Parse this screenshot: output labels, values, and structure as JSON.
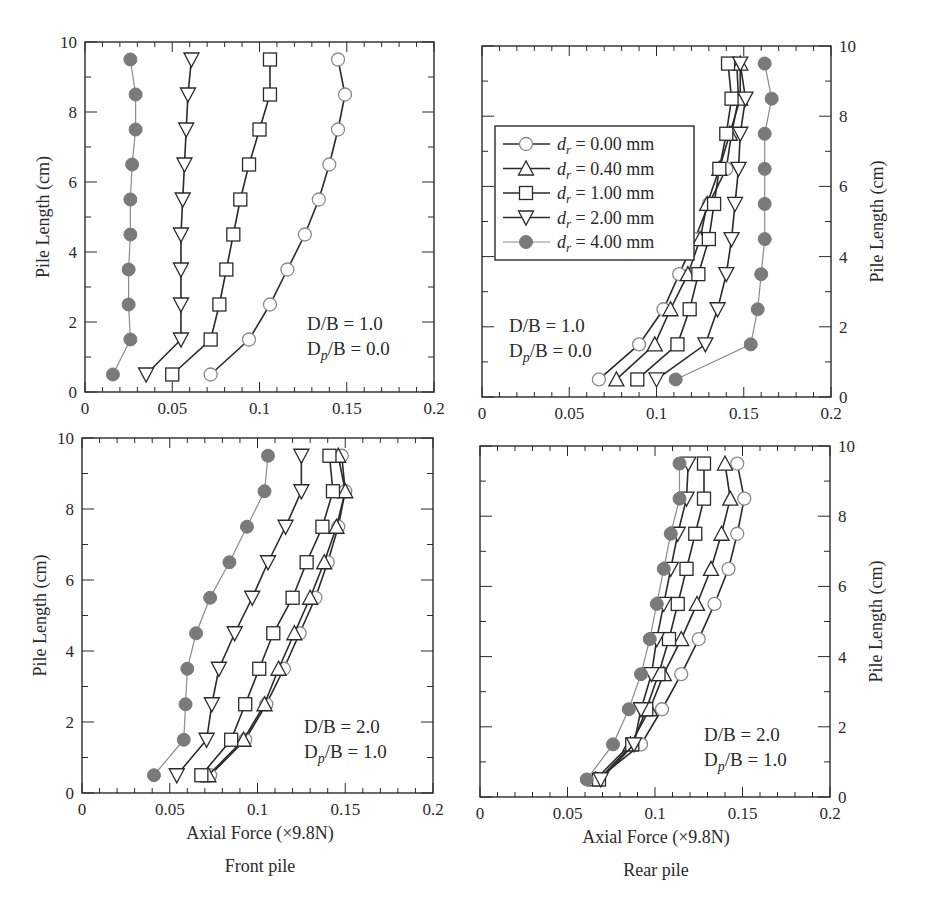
{
  "figure": {
    "captions": {
      "front_xlabel": "Axial Force (×9.8N)",
      "front_title": "Front pile",
      "rear_xlabel": "Axial Force (×9.8N)",
      "rear_title": "Rear pile"
    },
    "legend": [
      {
        "label": "d_r = 0.00 mm",
        "symbol": "r",
        "value": "= 0.00 mm",
        "marker": "circle-open",
        "color": "#2a2a2a"
      },
      {
        "label": "d_r = 0.40 mm",
        "symbol": "r",
        "value": "= 0.40 mm",
        "marker": "triangle-up-open",
        "color": "#2a2a2a"
      },
      {
        "label": "d_r = 1.00 mm",
        "symbol": "r",
        "value": "= 1.00 mm",
        "marker": "square-open",
        "color": "#2a2a2a"
      },
      {
        "label": "d_r = 2.00 mm",
        "symbol": "r",
        "value": "= 2.00 mm",
        "marker": "triangle-down-open",
        "color": "#2a2a2a"
      },
      {
        "label": "d_r = 4.00 mm",
        "symbol": "r",
        "value": "= 4.00 mm",
        "marker": "circle-filled",
        "color": "#7a7a7a"
      }
    ]
  },
  "chart_data": [
    {
      "type": "line",
      "panel": "top-left",
      "title": "Front pile",
      "annotation": [
        "D/B = 1.0",
        "Dp/B = 0.0"
      ],
      "xlabel": "",
      "ylabel": "Pile Length (cm)",
      "xlim": [
        0,
        0.2
      ],
      "ylim": [
        0,
        10
      ],
      "xticks": [
        "0",
        "0.05",
        "0.1",
        "0.15",
        "0.2"
      ],
      "yticks": [
        "0",
        "2",
        "4",
        "6",
        "8",
        "10"
      ],
      "y": [
        0.5,
        1.5,
        2.5,
        3.5,
        4.5,
        5.5,
        6.5,
        7.5,
        8.5,
        9.5
      ],
      "series": [
        {
          "name": "d_r = 0.00 mm",
          "values": [
            0.072,
            0.094,
            0.106,
            0.116,
            0.126,
            0.134,
            0.14,
            0.145,
            0.149,
            0.145
          ]
        },
        {
          "name": "d_r = 1.00 mm",
          "values": [
            0.05,
            0.072,
            0.077,
            0.081,
            0.085,
            0.089,
            0.094,
            0.1,
            0.106,
            0.106
          ]
        },
        {
          "name": "d_r = 2.00 mm",
          "values": [
            0.035,
            0.055,
            0.055,
            0.055,
            0.055,
            0.056,
            0.057,
            0.058,
            0.059,
            0.061
          ]
        },
        {
          "name": "d_r = 4.00 mm",
          "values": [
            0.016,
            0.026,
            0.025,
            0.025,
            0.026,
            0.026,
            0.027,
            0.029,
            0.029,
            0.026
          ]
        }
      ]
    },
    {
      "type": "line",
      "panel": "top-right",
      "title": "Rear pile",
      "annotation": [
        "D/B = 1.0",
        "Dp/B = 0.0"
      ],
      "xlabel": "",
      "ylabel": "Pile Length (cm)",
      "xlim": [
        0,
        0.2
      ],
      "ylim": [
        0,
        10
      ],
      "xticks": [
        "0",
        "0.05",
        "0.1",
        "0.15",
        "0.2"
      ],
      "yticks": [
        "0",
        "2",
        "4",
        "6",
        "8",
        "10"
      ],
      "legend_position": "upper-left",
      "y": [
        0.5,
        1.5,
        2.5,
        3.5,
        4.5,
        5.5,
        6.5,
        7.5,
        8.5,
        9.5
      ],
      "series": [
        {
          "name": "d_r = 0.00 mm",
          "values": [
            0.067,
            0.09,
            0.104,
            0.113,
            0.122,
            0.13,
            0.14,
            0.143,
            0.147,
            0.146
          ]
        },
        {
          "name": "d_r = 0.40 mm",
          "values": [
            0.077,
            0.099,
            0.108,
            0.118,
            0.125,
            0.129,
            0.136,
            0.142,
            0.148,
            0.148
          ]
        },
        {
          "name": "d_r = 1.00 mm",
          "values": [
            0.089,
            0.112,
            0.119,
            0.124,
            0.13,
            0.133,
            0.136,
            0.14,
            0.143,
            0.141
          ]
        },
        {
          "name": "d_r = 2.00 mm",
          "values": [
            0.1,
            0.128,
            0.135,
            0.14,
            0.143,
            0.145,
            0.147,
            0.148,
            0.151,
            0.148
          ]
        },
        {
          "name": "d_r = 4.00 mm",
          "values": [
            0.111,
            0.154,
            0.158,
            0.16,
            0.162,
            0.162,
            0.162,
            0.162,
            0.166,
            0.162
          ]
        }
      ]
    },
    {
      "type": "line",
      "panel": "bottom-left",
      "title": "Front pile",
      "annotation": [
        "D/B = 2.0",
        "Dp/B = 1.0"
      ],
      "xlabel": "Axial Force (×9.8N)",
      "ylabel": "Pile Length (cm)",
      "xlim": [
        0,
        0.2
      ],
      "ylim": [
        0,
        10
      ],
      "xticks": [
        "0",
        "0.05",
        "0.1",
        "0.15",
        "0.2"
      ],
      "yticks": [
        "0",
        "2",
        "4",
        "6",
        "8",
        "10"
      ],
      "y": [
        0.5,
        1.5,
        2.5,
        3.5,
        4.5,
        5.5,
        6.5,
        7.5,
        8.5,
        9.5
      ],
      "series": [
        {
          "name": "d_r = 0.00 mm",
          "values": [
            0.073,
            0.093,
            0.105,
            0.115,
            0.124,
            0.133,
            0.14,
            0.146,
            0.15,
            0.148
          ]
        },
        {
          "name": "d_r = 0.40 mm",
          "values": [
            0.072,
            0.092,
            0.104,
            0.112,
            0.121,
            0.13,
            0.138,
            0.145,
            0.15,
            0.146
          ]
        },
        {
          "name": "d_r = 1.00 mm",
          "values": [
            0.068,
            0.085,
            0.093,
            0.101,
            0.109,
            0.12,
            0.128,
            0.137,
            0.143,
            0.141
          ]
        },
        {
          "name": "d_r = 2.00 mm",
          "values": [
            0.054,
            0.071,
            0.074,
            0.078,
            0.087,
            0.097,
            0.106,
            0.116,
            0.125,
            0.125
          ]
        },
        {
          "name": "d_r = 4.00 mm",
          "values": [
            0.041,
            0.058,
            0.059,
            0.06,
            0.065,
            0.073,
            0.084,
            0.094,
            0.104,
            0.106
          ]
        }
      ]
    },
    {
      "type": "line",
      "panel": "bottom-right",
      "title": "Rear pile",
      "annotation": [
        "D/B = 2.0",
        "Dp/B = 1.0"
      ],
      "xlabel": "Axial Force (×9.8N)",
      "ylabel": "Pile Length (cm)",
      "xlim": [
        0,
        0.2
      ],
      "ylim": [
        0,
        10
      ],
      "xticks": [
        "0",
        "0.05",
        "0.1",
        "0.15",
        "0.2"
      ],
      "yticks": [
        "0",
        "2",
        "4",
        "6",
        "8",
        "10"
      ],
      "y": [
        0.5,
        1.5,
        2.5,
        3.5,
        4.5,
        5.5,
        6.5,
        7.5,
        8.5,
        9.5
      ],
      "series": [
        {
          "name": "d_r = 0.00 mm",
          "values": [
            0.067,
            0.092,
            0.104,
            0.115,
            0.125,
            0.134,
            0.142,
            0.147,
            0.151,
            0.147
          ]
        },
        {
          "name": "d_r = 0.40 mm",
          "values": [
            0.066,
            0.086,
            0.097,
            0.105,
            0.115,
            0.124,
            0.132,
            0.138,
            0.143,
            0.14
          ]
        },
        {
          "name": "d_r = 1.00 mm",
          "values": [
            0.068,
            0.087,
            0.095,
            0.102,
            0.108,
            0.113,
            0.118,
            0.123,
            0.128,
            0.128
          ]
        },
        {
          "name": "d_r = 2.00 mm",
          "values": [
            0.069,
            0.088,
            0.092,
            0.098,
            0.101,
            0.105,
            0.109,
            0.113,
            0.118,
            0.119
          ]
        },
        {
          "name": "d_r = 4.00 mm",
          "values": [
            0.061,
            0.076,
            0.085,
            0.092,
            0.097,
            0.101,
            0.105,
            0.109,
            0.114,
            0.114
          ]
        }
      ]
    }
  ]
}
